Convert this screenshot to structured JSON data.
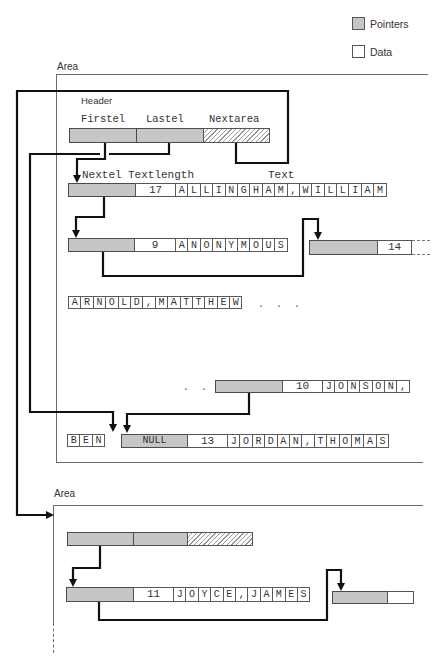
{
  "legend": {
    "pointers_label": "Pointers",
    "data_label": "Data",
    "pointers_color": "#c6c6c6",
    "data_color": "#ffffff"
  },
  "area1": {
    "label": "Area",
    "header": {
      "label": "Header",
      "fields": [
        "Firstel",
        "Lastel",
        "Nextarea"
      ]
    },
    "field_labels": {
      "nextel": "Nextel",
      "textlength": "Textlength",
      "text": "Text"
    },
    "records": [
      {
        "textlength": "17",
        "text": "ALLINGHAM,WILLIAM"
      },
      {
        "textlength": "9",
        "text": "ANONYMOUS"
      },
      {
        "text": "ARNOLD,MATTHEW",
        "ellipsis": ". . ."
      },
      {
        "ellipsis": ". . .",
        "textlength": "10",
        "text": "JONSON,"
      },
      {
        "text": "BEN"
      },
      {
        "nextel": "NULL",
        "textlength": "13",
        "text": "JORDAN,THOMAS"
      }
    ],
    "next_record_fragment": {
      "textlength": "14"
    }
  },
  "area2": {
    "label": "Area",
    "records": [
      {
        "textlength": "11",
        "text": "JOYCE,JAMES"
      }
    ]
  },
  "colors": {
    "pointer_fill": "#c6c6c6",
    "link_line": "#111111",
    "area_frame": "#6b6b6b"
  }
}
